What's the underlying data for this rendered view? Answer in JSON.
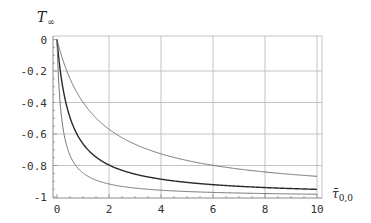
{
  "chart_data": {
    "type": "line",
    "title": "",
    "xlabel": "τ̄0,0",
    "xlabel_main": "τ̄",
    "xlabel_sub": "0,0",
    "ylabel": "T∞",
    "ylabel_main": "T",
    "ylabel_sub": "∞",
    "xlim": [
      0,
      10
    ],
    "ylim": [
      -1,
      0
    ],
    "grid": true,
    "legend": null,
    "xticks": [
      0,
      2,
      4,
      6,
      8,
      10
    ],
    "xtick_labels": [
      "0",
      "2",
      "4",
      "6",
      "8",
      "10"
    ],
    "yticks": [
      0,
      -0.2,
      -0.4,
      -0.6,
      -0.8,
      -1
    ],
    "ytick_labels": [
      "0",
      "-0.2",
      "-0.4",
      "-0.6",
      "-0.8",
      "-1"
    ],
    "x": [
      0,
      0.1,
      0.25,
      0.5,
      1,
      2,
      3,
      4,
      5,
      6,
      7,
      8,
      9,
      10
    ],
    "series": [
      {
        "name": "upper curve",
        "color": "#707070",
        "width": 1,
        "values": [
          0,
          -0.06,
          -0.14,
          -0.25,
          -0.4,
          -0.6,
          -0.67,
          -0.72,
          -0.76,
          -0.79,
          -0.81,
          -0.83,
          -0.85,
          -0.86
        ]
      },
      {
        "name": "middle curve",
        "color": "#2a2a2a",
        "width": 1.4,
        "values": [
          0,
          -0.17,
          -0.33,
          -0.5,
          -0.67,
          -0.79,
          -0.85,
          -0.87,
          -0.9,
          -0.91,
          -0.93,
          -0.94,
          -0.945,
          -0.95
        ]
      },
      {
        "name": "lower curve",
        "color": "#707070",
        "width": 1,
        "values": [
          0,
          -0.36,
          -0.58,
          -0.74,
          -0.85,
          -0.92,
          -0.94,
          -0.95,
          -0.965,
          -0.97,
          -0.975,
          -0.978,
          -0.98,
          -0.982
        ]
      }
    ]
  },
  "colors": {
    "grid": "#c4c4c4",
    "axis": "#8a8a8a",
    "frame": "#c4c4c4"
  }
}
